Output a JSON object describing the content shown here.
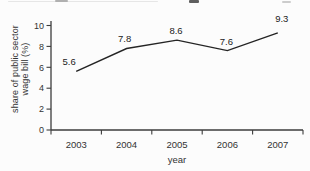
{
  "chart_data": {
    "type": "line",
    "categories": [
      "2003",
      "2004",
      "2005",
      "2006",
      "2007"
    ],
    "values": [
      5.6,
      7.8,
      8.6,
      7.6,
      9.3
    ],
    "data_labels": [
      "5.6",
      "7.8",
      "8.6",
      "7.6",
      "9.3"
    ],
    "title": "",
    "xlabel": "year",
    "ylabel": "share of public sector wage bill (%)",
    "ylabel_lines": [
      "share of public sector",
      "wage bill (%)"
    ],
    "yticks": [
      0,
      2,
      4,
      6,
      8,
      10
    ],
    "ylim": [
      0,
      10
    ],
    "grid": false,
    "legend": "none",
    "markers": false,
    "line_color": "#242424",
    "axis_color": "#3c3c3c",
    "tick_label_color": "#333333",
    "data_label_color": "#222222"
  }
}
